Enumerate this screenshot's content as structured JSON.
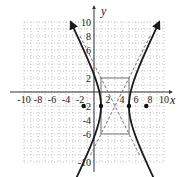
{
  "chart_data": {
    "type": "line",
    "title": "",
    "xlabel": "x",
    "ylabel": "y",
    "xlim": [
      -10,
      10
    ],
    "ylim": [
      -10,
      10
    ],
    "grid": true,
    "x_tick_labels": [
      "-10",
      "-8",
      "-6",
      "-4",
      "-2",
      "2",
      "4",
      "6",
      "8",
      "10"
    ],
    "y_tick_labels": [
      "10",
      "8",
      "6",
      "2",
      "-2",
      "-4",
      "-6",
      "-10"
    ],
    "x_ticks": [
      -10,
      -8,
      -6,
      -4,
      -2,
      2,
      4,
      6,
      8,
      10
    ],
    "y_ticks": [
      10,
      8,
      6,
      2,
      -2,
      -4,
      -6,
      -10
    ],
    "curve": {
      "name": "hyperbola",
      "equation": "(x-3)^2/4 - (y+2)^2/16 = 1",
      "center": [
        3,
        -2
      ],
      "a": 2,
      "b": 4,
      "vertices": [
        [
          1,
          -2
        ],
        [
          5,
          -2
        ]
      ],
      "foci": [
        [
          -1.47,
          -2
        ],
        [
          7.47,
          -2
        ]
      ],
      "asymptotes": [
        "y + 2 = 2(x - 3)",
        "y + 2 = -2(x - 3)"
      ],
      "style": "solid bold with arrowheads"
    },
    "fundamental_rectangle": {
      "x": [
        1,
        5
      ],
      "y": [
        -6,
        2
      ],
      "style": "solid gray"
    },
    "asymptote_style": "dashed gray",
    "points": [
      {
        "label": "vertex",
        "x": 1,
        "y": -2
      },
      {
        "label": "vertex",
        "x": 5,
        "y": -2
      },
      {
        "label": "focus",
        "x": -1.47,
        "y": -2
      },
      {
        "label": "focus",
        "x": 7.47,
        "y": -2
      }
    ]
  },
  "labels": {
    "x_axis": "x",
    "y_axis": "y"
  }
}
